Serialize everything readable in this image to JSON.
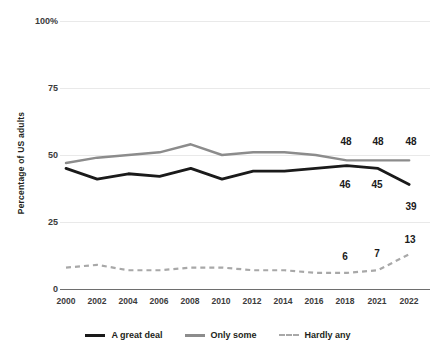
{
  "chart_data": {
    "type": "line",
    "title": "",
    "xlabel": "",
    "ylabel": "Percentage of US adults",
    "ylim": [
      0,
      100
    ],
    "yticks": [
      "0",
      "25",
      "50",
      "75",
      "100%"
    ],
    "ytick_values": [
      0,
      25,
      50,
      75,
      100
    ],
    "grid": true,
    "legend_position": "bottom",
    "categories": [
      "2000",
      "2002",
      "2004",
      "2006",
      "2008",
      "2010",
      "2012",
      "2014",
      "2016",
      "2018",
      "2021",
      "2022"
    ],
    "series": [
      {
        "name": "A great deal",
        "color": "#1a1a1a",
        "style": "solid",
        "values": [
          45,
          41,
          43,
          42,
          45,
          41,
          44,
          44,
          45,
          46,
          45,
          39
        ]
      },
      {
        "name": "Only some",
        "color": "#8c8c8c",
        "style": "solid",
        "values": [
          47,
          49,
          50,
          51,
          54,
          50,
          51,
          51,
          50,
          48,
          48,
          48
        ]
      },
      {
        "name": "Hardly any",
        "color": "#a8a8a8",
        "style": "dashed",
        "values": [
          8,
          9,
          7,
          7,
          8,
          8,
          7,
          7,
          6,
          6,
          7,
          13
        ]
      }
    ],
    "data_labels": [
      {
        "text": "48",
        "series": "Only some",
        "category": "2018"
      },
      {
        "text": "48",
        "series": "Only some",
        "category": "2021"
      },
      {
        "text": "48",
        "series": "Only some",
        "category": "2022"
      },
      {
        "text": "46",
        "series": "A great deal",
        "category": "2018"
      },
      {
        "text": "45",
        "series": "A great deal",
        "category": "2021"
      },
      {
        "text": "39",
        "series": "A great deal",
        "category": "2022"
      },
      {
        "text": "6",
        "series": "Hardly any",
        "category": "2018"
      },
      {
        "text": "7",
        "series": "Hardly any",
        "category": "2021"
      },
      {
        "text": "13",
        "series": "Hardly any",
        "category": "2022"
      }
    ]
  },
  "legend": {
    "items": [
      {
        "label": "A great deal"
      },
      {
        "label": "Only some"
      },
      {
        "label": "Hardly any"
      }
    ]
  },
  "labels": {
    "l48a": "48",
    "l48b": "48",
    "l48c": "48",
    "l46": "46",
    "l45": "45",
    "l39": "39",
    "l6": "6",
    "l7": "7",
    "l13": "13"
  },
  "yaxis": {
    "t0": "0",
    "t25": "25",
    "t50": "50",
    "t75": "75",
    "t100": "100%",
    "title": "Percentage of US adults"
  },
  "xaxis": {
    "t0": "2000",
    "t1": "2002",
    "t2": "2004",
    "t3": "2006",
    "t4": "2008",
    "t5": "2010",
    "t6": "2012",
    "t7": "2014",
    "t8": "2016",
    "t9": "2018",
    "t10": "2021",
    "t11": "2022"
  }
}
